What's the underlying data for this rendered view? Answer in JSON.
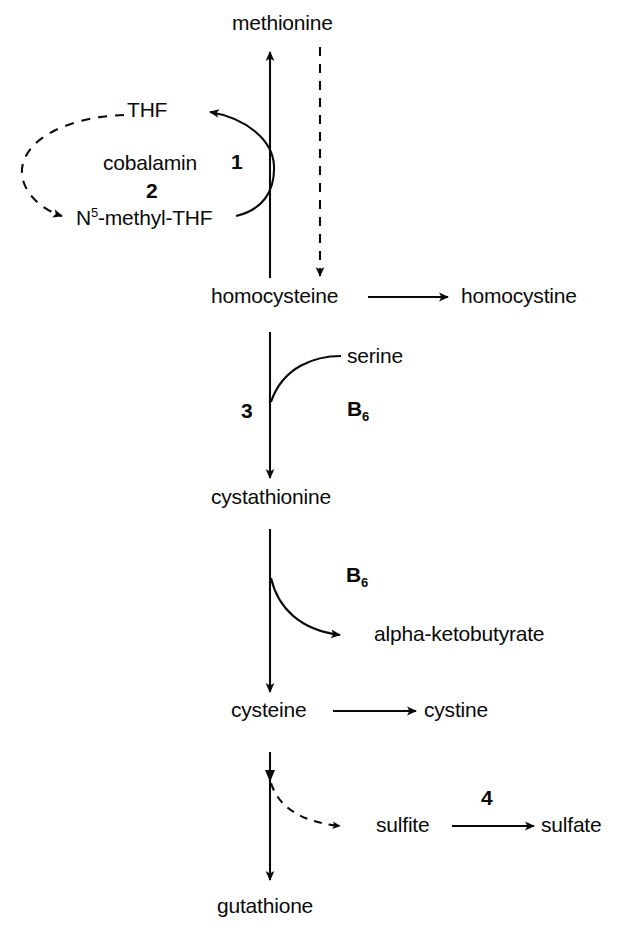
{
  "diagram": {
    "ink_color": "#0a0a0a",
    "background_color": "#ffffff",
    "metabolites": {
      "methionine": "methionine",
      "thf": "THF",
      "n5_methyl_thf_prefix": "N",
      "n5_methyl_thf_super": "5",
      "n5_methyl_thf_suffix": "-methyl-THF",
      "homocysteine": "homocysteine",
      "homocystine": "homocystine",
      "cystathionine": "cystathionine",
      "cysteine": "cysteine",
      "cystine": "cystine",
      "serine": "serine",
      "alpha_ketobutyrate": "alpha-ketobutyrate",
      "sulfite": "sulfite",
      "sulfate": "sulfate",
      "gutathione": "gutathione"
    },
    "cofactors": {
      "cobalamin": "cobalamin",
      "b6_upper_letter": "B",
      "b6_upper_sub": "6",
      "b6_lower_letter": "B",
      "b6_lower_sub": "6"
    },
    "enzyme_numbers": {
      "one": "1",
      "two": "2",
      "three": "3",
      "four": "4"
    },
    "arrows": [
      {
        "name": "homocysteine-to-methionine",
        "style": "solid",
        "direction": "up"
      },
      {
        "name": "methionine-to-homocysteine",
        "style": "dashed",
        "direction": "down"
      },
      {
        "name": "n5-methyl-thf-to-thf",
        "style": "solid",
        "direction": "curve-left-up"
      },
      {
        "name": "thf-to-n5-methyl-thf",
        "style": "dashed",
        "direction": "loop-left-down"
      },
      {
        "name": "homocysteine-to-homocystine",
        "style": "solid",
        "direction": "right"
      },
      {
        "name": "homocysteine-to-cystathionine",
        "style": "solid",
        "direction": "down"
      },
      {
        "name": "serine-into-pathway",
        "style": "solid",
        "direction": "curve-in"
      },
      {
        "name": "cystathionine-to-cysteine",
        "style": "solid",
        "direction": "down"
      },
      {
        "name": "cystathionine-to-alpha-ketobutyrate",
        "style": "solid",
        "direction": "curve-out-right"
      },
      {
        "name": "cysteine-to-cystine",
        "style": "solid",
        "direction": "right"
      },
      {
        "name": "cysteine-to-gutathione",
        "style": "solid",
        "direction": "down"
      },
      {
        "name": "cysteine-to-sulfite",
        "style": "dashed",
        "direction": "curve-out-right"
      },
      {
        "name": "sulfite-to-sulfate",
        "style": "solid",
        "direction": "right"
      }
    ]
  }
}
